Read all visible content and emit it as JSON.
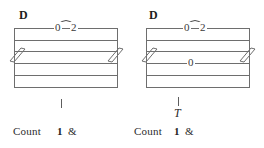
{
  "document": {
    "kind": "guitar-tablature-figure",
    "background_color": "#ffffff",
    "ink_color": "#2b2b2b",
    "staff_line_color": "#6e6e6e"
  },
  "panels": [
    {
      "id": "left",
      "chord_symbol": "D",
      "staff": {
        "line_count": 6,
        "has_break_marks": true,
        "break_mark_positions": [
          "left",
          "right"
        ]
      },
      "fret_numbers": [
        {
          "value": "0",
          "string_line": 1,
          "beat": 1
        },
        {
          "value": "2",
          "string_line": 1,
          "beat": 1
        }
      ],
      "slur": {
        "from": "0",
        "to": "2",
        "shape": "arc-over"
      },
      "rhythm": {
        "stem_tick": true,
        "technique_letter": ""
      },
      "count": {
        "label": "Count",
        "beats": [
          "1",
          "&"
        ]
      }
    },
    {
      "id": "right",
      "chord_symbol": "D",
      "staff": {
        "line_count": 6,
        "has_break_marks": true,
        "break_mark_positions": [
          "left",
          "right"
        ]
      },
      "fret_numbers": [
        {
          "value": "0",
          "string_line": 1,
          "beat": 1
        },
        {
          "value": "2",
          "string_line": 1,
          "beat": 1
        },
        {
          "value": "0",
          "string_line": 4,
          "beat": 1
        }
      ],
      "slur": {
        "from": "0",
        "to": "2",
        "shape": "arc-over"
      },
      "rhythm": {
        "stem_tick": true,
        "technique_letter": "T"
      },
      "count": {
        "label": "Count",
        "beats": [
          "1",
          "&"
        ]
      }
    }
  ]
}
